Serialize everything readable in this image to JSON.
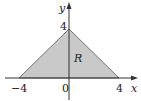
{
  "diagram": {
    "type": "region-plot",
    "region": {
      "label": "R",
      "shape": "triangle",
      "vertices": [
        [
          -4,
          0
        ],
        [
          4,
          0
        ],
        [
          0,
          4
        ]
      ],
      "fill": "#c9c9c9",
      "stroke": "#555555"
    },
    "axes": {
      "x_label": "x",
      "y_label": "y",
      "x_ticks": [
        "−4",
        "0",
        "4"
      ],
      "y_ticks": [
        "4"
      ]
    },
    "colors": {
      "axis": "#333333",
      "background": "#ffffff"
    }
  }
}
